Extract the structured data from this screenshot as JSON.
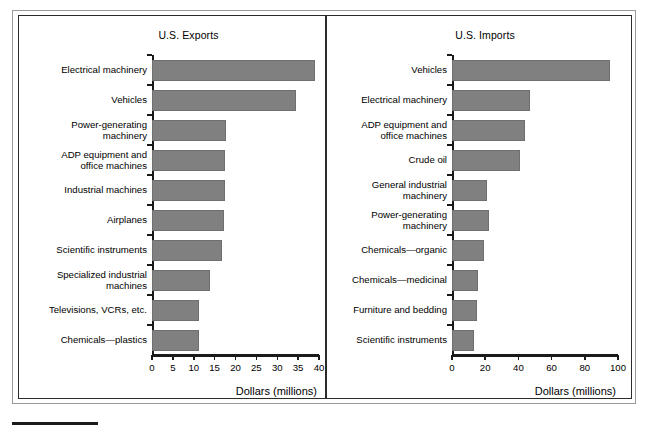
{
  "figure": {
    "bar_color": "#808080",
    "axis_color": "#1a1a1a",
    "frame_color": "#2b2b2b"
  },
  "chart_data": [
    {
      "type": "bar",
      "orientation": "horizontal",
      "title": "U.S. Exports",
      "xlabel": "Dollars (millions)",
      "ylabel": "",
      "xlim": [
        0,
        40
      ],
      "xticks": [
        0,
        5,
        10,
        15,
        20,
        25,
        30,
        35,
        40
      ],
      "xtick_labels": [
        "0",
        "5",
        "10",
        "15",
        "20",
        "25",
        "30",
        "35",
        "40"
      ],
      "grid": false,
      "legend": "none",
      "categories": [
        "Electrical machinery",
        "Vehicles",
        "Power-generating\nmachinery",
        "ADP equipment and\noffice machines",
        "Industrial machines",
        "Airplanes",
        "Scientific instruments",
        "Specialized industrial\nmachines",
        "Televisions, VCRs, etc.",
        "Chemicals—plastics"
      ],
      "values": [
        39.0,
        34.5,
        17.8,
        17.6,
        17.5,
        17.2,
        16.8,
        14.0,
        11.3,
        11.2
      ]
    },
    {
      "type": "bar",
      "orientation": "horizontal",
      "title": "U.S. Imports",
      "xlabel": "Dollars (millions)",
      "ylabel": "",
      "xlim": [
        0,
        100
      ],
      "xticks": [
        0,
        20,
        40,
        60,
        80,
        100
      ],
      "xtick_labels": [
        "0",
        "20",
        "40",
        "60",
        "80",
        "100"
      ],
      "grid": false,
      "legend": "none",
      "categories": [
        "Vehicles",
        "Electrical machinery",
        "ADP equipment and\noffice machines",
        "Crude oil",
        "General industrial\nmachinery",
        "Power-generating\nmachinery",
        "Chemicals—organic",
        "Chemicals—medicinal",
        "Furniture and bedding",
        "Scientific instruments"
      ],
      "values": [
        95.0,
        47.0,
        44.0,
        41.0,
        21.0,
        22.0,
        19.0,
        15.5,
        15.0,
        13.5
      ]
    }
  ]
}
